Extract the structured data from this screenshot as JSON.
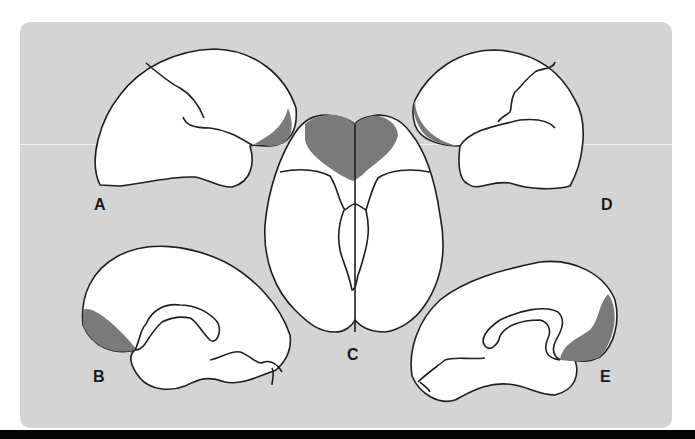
{
  "figure": {
    "background_color": "#d4d4d4",
    "outline_color": "#1e1e1e",
    "brain_fill": "#ffffff",
    "highlight_fill": "#7a7a7a",
    "bottom_bar_color": "#050505"
  },
  "views": [
    {
      "label": "A",
      "description": "left lateral view, frontal pole highlighted (right side)"
    },
    {
      "label": "B",
      "description": "medial view, frontal pole highlighted (left side)"
    },
    {
      "label": "C",
      "description": "ventral/inferior view, orbitofrontal region highlighted (top)"
    },
    {
      "label": "D",
      "description": "right lateral view, frontal pole highlighted (left side)"
    },
    {
      "label": "E",
      "description": "medial view, frontal pole highlighted (right side)"
    }
  ]
}
